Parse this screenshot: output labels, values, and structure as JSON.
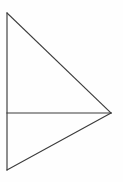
{
  "figure": {
    "background_color": "#fefefe",
    "stroke_color": "#3b3b3b",
    "stroke_width": 1.15,
    "canvas": {
      "width": 123,
      "height": 182
    },
    "points": {
      "top_left": {
        "x": 7,
        "y": 13
      },
      "mid_left": {
        "x": 7,
        "y": 113
      },
      "bottom_left": {
        "x": 7,
        "y": 170
      },
      "right_apex": {
        "x": 111,
        "y": 113
      }
    },
    "segments": [
      {
        "name": "left-vertical-edge",
        "x1": 7,
        "y1": 13,
        "x2": 7,
        "y2": 170
      },
      {
        "name": "upper-hypotenuse",
        "x1": 7,
        "y1": 13,
        "x2": 111,
        "y2": 113
      },
      {
        "name": "lower-hypotenuse",
        "x1": 7,
        "y1": 170,
        "x2": 111,
        "y2": 113
      },
      {
        "name": "horizontal-base",
        "x1": 7,
        "y1": 113,
        "x2": 111,
        "y2": 113
      }
    ]
  },
  "chart_data": {
    "type": "line",
    "xlabel": "",
    "ylabel": "",
    "xlim": [
      0,
      123
    ],
    "ylim": [
      0,
      182
    ],
    "grid": false,
    "legend": "none",
    "series": [
      {
        "name": "left-vertical-edge",
        "x": [
          7,
          7
        ],
        "y": [
          13,
          170
        ]
      },
      {
        "name": "upper-hypotenuse",
        "x": [
          7,
          111
        ],
        "y": [
          13,
          113
        ]
      },
      {
        "name": "lower-hypotenuse",
        "x": [
          7,
          111
        ],
        "y": [
          170,
          113
        ]
      },
      {
        "name": "horizontal-base",
        "x": [
          7,
          111
        ],
        "y": [
          113,
          113
        ]
      }
    ]
  }
}
